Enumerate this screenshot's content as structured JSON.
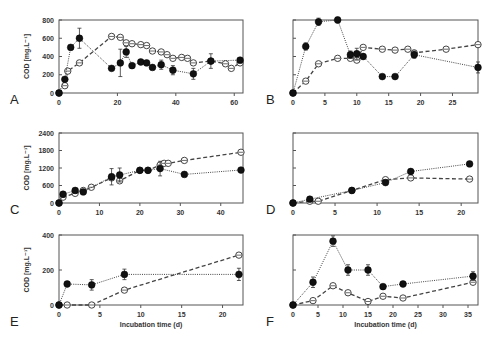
{
  "chart_data": [
    {
      "panel": "A",
      "type": "line",
      "ylabel": "COD [mg.L⁻¹]",
      "xlabel": "",
      "xlim": [
        0,
        63
      ],
      "ylim": [
        0,
        800
      ],
      "xticks": [
        0,
        20,
        40,
        60
      ],
      "yticks": [
        0,
        200,
        400,
        600,
        800
      ],
      "series": [
        {
          "name": "filled",
          "marker": "filled",
          "line": "dotted",
          "x": [
            0,
            2,
            4,
            7,
            18,
            21,
            23,
            25,
            28,
            30,
            32,
            35,
            39,
            46,
            52,
            62
          ],
          "y": [
            0,
            150,
            500,
            600,
            270,
            330,
            450,
            300,
            340,
            330,
            280,
            310,
            250,
            210,
            350,
            360
          ],
          "err": [
            0,
            20,
            0,
            110,
            0,
            150,
            60,
            0,
            0,
            0,
            0,
            50,
            50,
            60,
            80,
            0
          ]
        },
        {
          "name": "open",
          "marker": "open",
          "line": "dashed",
          "x": [
            0,
            2,
            3,
            7,
            18,
            21,
            23,
            25,
            28,
            30,
            32,
            35,
            37,
            39,
            42,
            44,
            46,
            52,
            57,
            59,
            62
          ],
          "y": [
            0,
            80,
            240,
            330,
            620,
            610,
            550,
            540,
            530,
            520,
            460,
            450,
            420,
            380,
            390,
            380,
            330,
            350,
            320,
            270,
            330
          ],
          "err": []
        }
      ]
    },
    {
      "panel": "B",
      "type": "line",
      "ylabel": "",
      "xlabel": "",
      "xlim": [
        0,
        29
      ],
      "ylim": [
        0,
        800
      ],
      "xticks": [
        0,
        5,
        10,
        15,
        20,
        25
      ],
      "yticks": [
        0,
        200,
        400,
        600,
        800
      ],
      "series": [
        {
          "name": "filled",
          "marker": "filled",
          "line": "dotted",
          "x": [
            0,
            2,
            4,
            7,
            9,
            10,
            11,
            14,
            16,
            19,
            29
          ],
          "y": [
            0,
            510,
            780,
            800,
            420,
            430,
            400,
            180,
            180,
            420,
            280
          ],
          "err": [
            0,
            40,
            40,
            30,
            40,
            60,
            0,
            0,
            0,
            40,
            60
          ]
        },
        {
          "name": "open",
          "marker": "open",
          "line": "dashed",
          "x": [
            0,
            2,
            4,
            7,
            9,
            10,
            11,
            14,
            16,
            18,
            19,
            24,
            29
          ],
          "y": [
            0,
            130,
            320,
            380,
            380,
            360,
            500,
            480,
            470,
            480,
            440,
            480,
            530
          ],
          "err": []
        }
      ]
    },
    {
      "panel": "C",
      "type": "line",
      "ylabel": "COD [mg.L⁻¹]",
      "xlabel": "",
      "xlim": [
        0,
        45.5
      ],
      "ylim": [
        0,
        2400
      ],
      "xticks": [
        0,
        10,
        20,
        30,
        40
      ],
      "yticks": [
        0,
        600,
        1200,
        1800,
        2400
      ],
      "series": [
        {
          "name": "filled",
          "marker": "filled",
          "line": "dotted",
          "x": [
            0,
            1,
            4,
            6,
            13,
            15,
            20,
            22,
            25,
            31,
            45
          ],
          "y": [
            0,
            300,
            430,
            380,
            900,
            960,
            1120,
            1120,
            1180,
            980,
            1130
          ],
          "err": [
            0,
            0,
            0,
            0,
            280,
            240,
            0,
            0,
            250,
            0,
            0
          ]
        },
        {
          "name": "open",
          "marker": "open",
          "line": "dashed",
          "x": [
            0,
            1,
            4,
            6,
            8,
            13,
            15,
            20,
            22,
            25,
            26,
            27,
            31,
            45
          ],
          "y": [
            0,
            200,
            330,
            430,
            540,
            860,
            760,
            1120,
            1120,
            1300,
            1360,
            1360,
            1460,
            1740
          ],
          "err": []
        }
      ]
    },
    {
      "panel": "D",
      "type": "line",
      "ylabel": "",
      "xlabel": "",
      "xlim": [
        0,
        22
      ],
      "ylim": [
        0,
        2400
      ],
      "xticks": [
        0,
        5,
        10,
        15,
        20
      ],
      "yticks": [
        0,
        600,
        1200,
        1800,
        2400
      ],
      "series": [
        {
          "name": "filled",
          "marker": "filled",
          "line": "dotted",
          "x": [
            0,
            2,
            7,
            11,
            14,
            21
          ],
          "y": [
            0,
            130,
            430,
            700,
            1080,
            1340
          ],
          "err": [
            0,
            0,
            0,
            0,
            0,
            0
          ]
        },
        {
          "name": "open",
          "marker": "open",
          "line": "dashed",
          "x": [
            0,
            2,
            3,
            7,
            11,
            14,
            21
          ],
          "y": [
            0,
            60,
            60,
            430,
            800,
            860,
            820
          ],
          "err": []
        }
      ]
    },
    {
      "panel": "E",
      "type": "line",
      "ylabel": "COD [mg.L⁻¹]",
      "xlabel": "Incubation time (d)",
      "xlim": [
        0,
        22.5
      ],
      "ylim": [
        0,
        400
      ],
      "xticks": [
        0,
        5,
        10,
        15,
        20
      ],
      "yticks": [
        0,
        200,
        400
      ],
      "series": [
        {
          "name": "filled",
          "marker": "filled",
          "line": "dotted",
          "x": [
            0,
            1,
            4,
            8,
            22
          ],
          "y": [
            0,
            120,
            115,
            175,
            175
          ],
          "err": [
            0,
            0,
            30,
            30,
            35
          ]
        },
        {
          "name": "open",
          "marker": "open",
          "line": "dashed",
          "x": [
            0,
            1,
            4,
            8,
            22
          ],
          "y": [
            0,
            0,
            0,
            85,
            285
          ],
          "err": []
        }
      ]
    },
    {
      "panel": "F",
      "type": "line",
      "ylabel": "",
      "xlabel": "Incubation time (d)",
      "xlim": [
        0,
        37
      ],
      "ylim": [
        0,
        400
      ],
      "xticks": [
        0,
        5,
        10,
        15,
        20,
        25,
        30,
        35
      ],
      "yticks": [
        0,
        200,
        400
      ],
      "series": [
        {
          "name": "filled",
          "marker": "filled",
          "line": "dotted",
          "x": [
            0,
            4,
            8,
            11,
            15,
            18,
            22,
            36
          ],
          "y": [
            0,
            130,
            365,
            200,
            200,
            105,
            120,
            165
          ],
          "err": [
            0,
            30,
            30,
            30,
            30,
            0,
            0,
            25
          ]
        },
        {
          "name": "open",
          "marker": "open",
          "line": "dashed",
          "x": [
            0,
            4,
            8,
            11,
            15,
            18,
            22,
            36
          ],
          "y": [
            0,
            25,
            110,
            70,
            20,
            50,
            40,
            130
          ],
          "err": []
        }
      ]
    }
  ],
  "figure": {
    "panel_labels": [
      "A",
      "B",
      "C",
      "D",
      "E",
      "F"
    ],
    "colors": {
      "axis": "#555555",
      "marker_fill": "#111111",
      "open_stroke": "#444444",
      "line": "#444444"
    }
  }
}
